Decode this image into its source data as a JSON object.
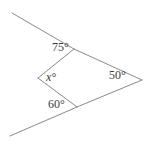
{
  "figure": {
    "kind": "angle-diagram",
    "background_color": "#ffffff",
    "stroke_color": "#8a8a8a",
    "text_color": "#3c3c3c",
    "stroke_width": 1,
    "width": 151,
    "height": 146,
    "labels": {
      "angle_top": "75°",
      "angle_left": "x°",
      "angle_bottom": "60°",
      "angle_right": "50°"
    },
    "vertices": {
      "top": {
        "x": 74,
        "y": 49
      },
      "left": {
        "x": 38,
        "y": 78
      },
      "bottom": {
        "x": 77,
        "y": 107
      },
      "right": {
        "x": 142,
        "y": 80
      },
      "ray_top_end": {
        "x": 12,
        "y": 13
      },
      "ray_bottom_end": {
        "x": 10,
        "y": 136
      }
    },
    "segments": [
      {
        "name": "upper-ray",
        "from": "ray_top_end",
        "to": "top"
      },
      {
        "name": "top-to-right",
        "from": "top",
        "to": "right"
      },
      {
        "name": "right-to-bottom",
        "from": "right",
        "to": "bottom"
      },
      {
        "name": "bottom-ray",
        "from": "bottom",
        "to": "ray_bottom_end"
      },
      {
        "name": "top-to-left",
        "from": "top",
        "to": "left"
      },
      {
        "name": "left-to-bottom",
        "from": "left",
        "to": "bottom"
      }
    ]
  }
}
